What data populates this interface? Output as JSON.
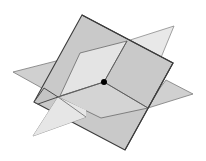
{
  "diagram": {
    "title": "Three planes intersecting at a single point",
    "colors": {
      "background": "#ffffff",
      "square_plane_fill": "#c8c8c8",
      "horizontal_plane_fill": "#d2d2d2",
      "light_plane_fill": "#e6e6e6",
      "edge_dark": "#3c3c3c",
      "edge_mid": "#7a7a7a",
      "point": "#000000"
    },
    "planes": [
      {
        "name": "tilted square plane",
        "shade": "medium grey"
      },
      {
        "name": "horizontal plane",
        "shade": "light grey"
      },
      {
        "name": "vertical plane",
        "shade": "lightest grey"
      }
    ],
    "intersection_point": {
      "label": "common point",
      "x": 104,
      "y": 82
    }
  }
}
